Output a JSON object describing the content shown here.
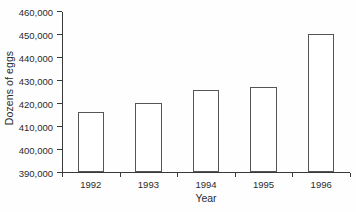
{
  "chart_data": {
    "type": "bar",
    "title": "",
    "xlabel": "Year",
    "ylabel": "Dozens of eggs",
    "categories": [
      "1992",
      "1993",
      "1994",
      "1995",
      "1996"
    ],
    "values": [
      416000,
      420000,
      425500,
      427000,
      450000
    ],
    "ylim": [
      390000,
      460000
    ],
    "ytick_step": 10000,
    "ytick_labels": [
      "390,000",
      "400,000",
      "410,000",
      "420,000",
      "430,000",
      "440,000",
      "450,000",
      "460,000"
    ],
    "ytick_values": [
      390000,
      400000,
      410000,
      420000,
      430000,
      440000,
      450000,
      460000
    ],
    "grid": false,
    "legend": false,
    "legend_position": "none",
    "bar_fill_color": "#ffffff",
    "bar_edge_color": "#555555",
    "axis_color": "#3a3a3a",
    "text_color": "#2b2b2b",
    "background_color": "#fefefe"
  }
}
